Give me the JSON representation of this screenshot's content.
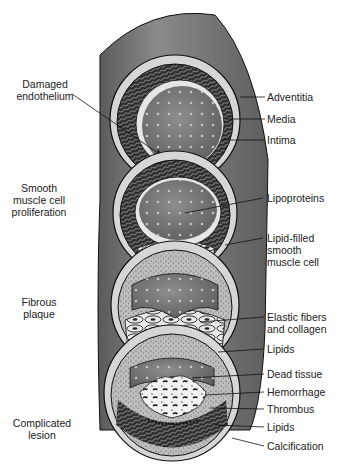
{
  "figure": {
    "colors": {
      "vessel_outer": "#6f6f6f",
      "vessel_outer_highlight": "#9a9a9a",
      "adventitia_ring": "#d4d4d4",
      "media_band": "#2a2a2a",
      "lumen": "#7c7c7c",
      "lumen_dots": "#b8b8b8",
      "outline": "#111111",
      "label_text": "#222222"
    }
  },
  "stage_labels": [
    {
      "id": "damaged-endothelium",
      "text": "Damaged\nendothelium"
    },
    {
      "id": "smooth-muscle-proliferation",
      "text": "Smooth\nmuscle cell\nproliferation"
    },
    {
      "id": "fibrous-plaque",
      "text": "Fibrous\nplaque"
    },
    {
      "id": "complicated-lesion",
      "text": "Complicated\nlesion"
    }
  ],
  "structure_labels": [
    {
      "id": "adventitia",
      "text": "Adventitia"
    },
    {
      "id": "media",
      "text": "Media"
    },
    {
      "id": "intima",
      "text": "Intima"
    },
    {
      "id": "lipoproteins",
      "text": "Lipoproteins"
    },
    {
      "id": "lipid-filled-smooth-muscle-cell",
      "text": "Lipid-filled\nsmooth\nmuscle cell"
    },
    {
      "id": "elastic-fibers-collagen",
      "text": "Elastic fibers\nand collagen"
    },
    {
      "id": "lipids-fibrous",
      "text": "Lipids"
    },
    {
      "id": "dead-tissue",
      "text": "Dead tissue"
    },
    {
      "id": "hemorrhage",
      "text": "Hemorrhage"
    },
    {
      "id": "thrombus",
      "text": "Thrombus"
    },
    {
      "id": "lipids-complicated",
      "text": "Lipids"
    },
    {
      "id": "calcification",
      "text": "Calcification"
    }
  ]
}
